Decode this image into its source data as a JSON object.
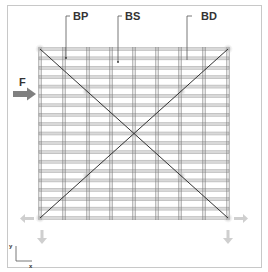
{
  "diagram": {
    "labels": {
      "bp": "BP",
      "bs": "BS",
      "bd": "BD",
      "force": "F",
      "axis_y": "y",
      "axis_x": "x"
    },
    "grid": {
      "x_left": 40,
      "x_right": 228,
      "y_top": 49,
      "y_bottom": 218,
      "vertical_columns_x": [
        40,
        64,
        88,
        111,
        134,
        157,
        180,
        204,
        228
      ],
      "horizontal_bar_count": 19
    },
    "colors": {
      "frame": "#c8c8c8",
      "bar_fill": "#d9d9d9",
      "bar_edge": "#9a9a9a",
      "column": "#7a7a7a",
      "brace": "#333333",
      "joint_glow": "#bbbbbb",
      "force_arrow": "#808080",
      "reaction_arrow": "#cfcfcf",
      "text": "#333333"
    },
    "icons": {
      "force_arrow": "right-arrow-icon",
      "reaction_left": "left-arrow-icon",
      "reaction_right": "right-arrow-icon",
      "reaction_down": "down-arrow-icon"
    }
  }
}
